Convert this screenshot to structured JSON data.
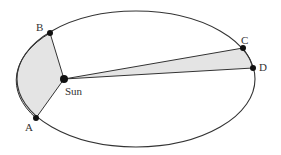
{
  "diagram": {
    "colors": {
      "orbit": "#333333",
      "fill": "#e4e4e4",
      "point": "#111111",
      "label": "#333333"
    },
    "orbit": {
      "cx": 136,
      "cy": 79,
      "rx": 119,
      "ry": 68
    },
    "points": {
      "A": {
        "label": "A",
        "x": 36,
        "y": 118
      },
      "B": {
        "label": "B",
        "x": 50,
        "y": 33
      },
      "C": {
        "label": "C",
        "x": 243,
        "y": 48
      },
      "D": {
        "label": "D",
        "x": 253,
        "y": 68
      },
      "Sun": {
        "label": "Sun",
        "x": 64,
        "y": 79
      }
    }
  }
}
